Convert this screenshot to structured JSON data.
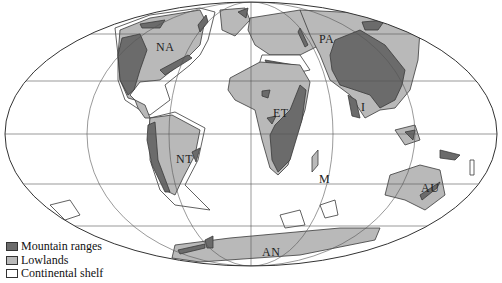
{
  "map": {
    "projection": "mollweide-like ellipse",
    "colors": {
      "mountain": "#6b6b6b",
      "lowland": "#b9b9b9",
      "shelf": "#ffffff",
      "outline": "#3a3a3a",
      "grid": "#555555"
    },
    "region_labels": [
      {
        "id": "NA",
        "text": "NA",
        "x": 156,
        "y": 40
      },
      {
        "id": "PA",
        "text": "PA",
        "x": 319,
        "y": 32
      },
      {
        "id": "ET",
        "text": "ET",
        "x": 273,
        "y": 106
      },
      {
        "id": "NT",
        "text": "NT",
        "x": 176,
        "y": 152
      },
      {
        "id": "I",
        "text": "I",
        "x": 361,
        "y": 100
      },
      {
        "id": "M",
        "text": "M",
        "x": 319,
        "y": 172
      },
      {
        "id": "AU",
        "text": "AU",
        "x": 421,
        "y": 181
      },
      {
        "id": "AN",
        "text": "AN",
        "x": 262,
        "y": 245
      }
    ]
  },
  "legend": {
    "items": [
      {
        "label": "Mountain ranges",
        "color": "#6b6b6b"
      },
      {
        "label": "Lowlands",
        "color": "#b9b9b9"
      },
      {
        "label": "Continental shelf",
        "color": "#ffffff"
      }
    ]
  }
}
